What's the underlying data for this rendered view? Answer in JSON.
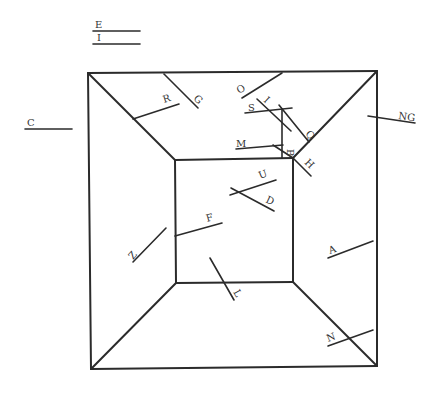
{
  "diagram": {
    "type": "labeled-line-segments-on-room-perspective",
    "frame": {
      "outer_square": {
        "tl": [
          88,
          73
        ],
        "tr": [
          377,
          71
        ],
        "br": [
          377,
          366
        ],
        "bl": [
          91,
          369
        ]
      },
      "inner_square": {
        "tl": [
          175,
          160
        ],
        "tr": [
          293,
          158
        ],
        "br": [
          293,
          282
        ],
        "bl": [
          176,
          283
        ]
      }
    },
    "segments": [
      {
        "label": "E",
        "x1": 93,
        "y1": 31,
        "x2": 140,
        "y2": 31,
        "lx": 95,
        "ly": 28,
        "rot": 0
      },
      {
        "label": "I",
        "x1": 93,
        "y1": 44,
        "x2": 140,
        "y2": 44,
        "lx": 97,
        "ly": 41,
        "rot": 0
      },
      {
        "label": "C",
        "x1": 25,
        "y1": 129,
        "x2": 72,
        "y2": 129,
        "lx": 27,
        "ly": 126,
        "rot": 0
      },
      {
        "label": "R",
        "x1": 133,
        "y1": 119,
        "x2": 179,
        "y2": 104,
        "lx": 164,
        "ly": 103,
        "rot": -18
      },
      {
        "label": "G",
        "x1": 164,
        "y1": 74,
        "x2": 198,
        "y2": 108,
        "lx": 193,
        "ly": 99,
        "rot": 45
      },
      {
        "label": "O",
        "x1": 242,
        "y1": 98,
        "x2": 282,
        "y2": 73,
        "lx": 239,
        "ly": 94,
        "rot": -30
      },
      {
        "label": "I",
        "x1": 257,
        "y1": 99,
        "x2": 291,
        "y2": 131,
        "lx": 263,
        "ly": 101,
        "rot": 43
      },
      {
        "label": "S",
        "x1": 245,
        "y1": 113,
        "x2": 292,
        "y2": 108,
        "lx": 248,
        "ly": 111,
        "rot": 0
      },
      {
        "label": "Q",
        "x1": 279,
        "y1": 105,
        "x2": 309,
        "y2": 142,
        "lx": 305,
        "ly": 134,
        "rot": 50
      },
      {
        "label": "",
        "x1": 282,
        "y1": 109,
        "x2": 282,
        "y2": 158,
        "lx": 0,
        "ly": 0,
        "rot": 0
      },
      {
        "label": "M",
        "x1": 236,
        "y1": 149,
        "x2": 283,
        "y2": 145,
        "lx": 236,
        "ly": 147,
        "rot": 0
      },
      {
        "label": "B",
        "x1": 273,
        "y1": 145,
        "x2": 293,
        "y2": 158,
        "lx": 287,
        "ly": 149,
        "rot": 90
      },
      {
        "label": "H",
        "x1": 293,
        "y1": 158,
        "x2": 311,
        "y2": 176,
        "lx": 304,
        "ly": 163,
        "rot": 45
      },
      {
        "label": "NG",
        "x1": 368,
        "y1": 116,
        "x2": 415,
        "y2": 123,
        "lx": 398,
        "ly": 119,
        "rot": 8
      },
      {
        "label": "U",
        "x1": 230,
        "y1": 195,
        "x2": 276,
        "y2": 180,
        "lx": 260,
        "ly": 179,
        "rot": -20
      },
      {
        "label": "D",
        "x1": 231,
        "y1": 188,
        "x2": 274,
        "y2": 211,
        "lx": 265,
        "ly": 202,
        "rot": 25
      },
      {
        "label": "F",
        "x1": 175,
        "y1": 236,
        "x2": 222,
        "y2": 223,
        "lx": 207,
        "ly": 222,
        "rot": -15
      },
      {
        "label": "Z",
        "x1": 133,
        "y1": 262,
        "x2": 166,
        "y2": 228,
        "lx": 133,
        "ly": 260,
        "rot": -50
      },
      {
        "label": "L",
        "x1": 210,
        "y1": 258,
        "x2": 234,
        "y2": 300,
        "lx": 233,
        "ly": 292,
        "rot": 60
      },
      {
        "label": "A",
        "x1": 328,
        "y1": 258,
        "x2": 373,
        "y2": 241,
        "lx": 330,
        "ly": 254,
        "rot": -20
      },
      {
        "label": "N",
        "x1": 328,
        "y1": 346,
        "x2": 373,
        "y2": 330,
        "lx": 328,
        "ly": 342,
        "rot": -20
      }
    ]
  }
}
